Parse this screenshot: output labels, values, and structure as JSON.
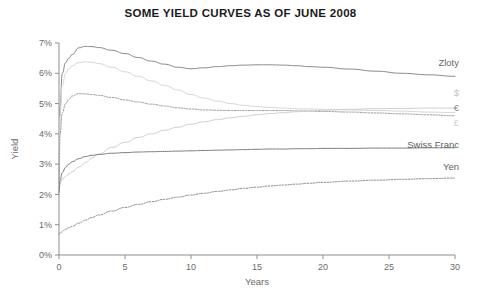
{
  "chart_data": {
    "type": "line",
    "title": "SOME YIELD CURVES AS OF JUNE 2008",
    "xlabel": "Years",
    "ylabel": "Yield",
    "xlim": [
      0,
      30
    ],
    "ylim": [
      0,
      7
    ],
    "xticks": [
      0,
      5,
      10,
      15,
      20,
      25,
      30
    ],
    "xtick_labels": [
      "0",
      "5",
      "10",
      "15",
      "20",
      "25",
      "30"
    ],
    "yticks": [
      0,
      1,
      2,
      3,
      4,
      5,
      6,
      7
    ],
    "ytick_labels": [
      "0%",
      "1%",
      "2%",
      "3%",
      "4%",
      "5%",
      "6%",
      "7%"
    ],
    "grid": false,
    "legend_position": "right-inline-labels",
    "series": [
      {
        "name": "Zloty",
        "label": "Zloty",
        "color": "#8a8a8a",
        "style": "solid",
        "width": 1.0,
        "label_color": "#6a6a6a",
        "x": [
          0,
          0.08,
          0.25,
          0.5,
          0.75,
          1,
          1.5,
          2,
          2.5,
          3,
          4,
          5,
          6,
          7,
          8,
          9,
          10,
          11,
          12,
          13,
          14,
          15,
          16,
          17,
          18,
          19,
          20,
          22,
          24,
          26,
          28,
          30
        ],
        "y": [
          2.35,
          4.9,
          6.0,
          6.35,
          6.5,
          6.62,
          6.84,
          6.89,
          6.88,
          6.85,
          6.76,
          6.65,
          6.52,
          6.4,
          6.3,
          6.2,
          6.15,
          6.18,
          6.22,
          6.25,
          6.27,
          6.28,
          6.28,
          6.27,
          6.25,
          6.22,
          6.2,
          6.14,
          6.07,
          6.0,
          5.95,
          5.9
        ]
      },
      {
        "name": "Pound",
        "label": "£",
        "color": "#d6d6d6",
        "style": "solid",
        "width": 1.0,
        "label_color": "#d0d0d0",
        "x": [
          0,
          0.08,
          0.25,
          0.5,
          0.75,
          1,
          1.5,
          2,
          2.5,
          3,
          4,
          5,
          6,
          7,
          8,
          9,
          10,
          11,
          12,
          13,
          14,
          15,
          16,
          17,
          18,
          19,
          20,
          22,
          24,
          26,
          28,
          30
        ],
        "y": [
          2.3,
          4.6,
          5.6,
          6.0,
          6.15,
          6.25,
          6.35,
          6.38,
          6.36,
          6.32,
          6.2,
          6.05,
          5.9,
          5.75,
          5.6,
          5.45,
          5.3,
          5.18,
          5.08,
          5.0,
          4.94,
          4.9,
          4.87,
          4.85,
          4.83,
          4.82,
          4.81,
          4.79,
          4.77,
          4.75,
          4.72,
          4.7
        ]
      },
      {
        "name": "Euro",
        "label": "€",
        "color": "#9a9a9a",
        "style": "dotted",
        "width": 1.0,
        "label_color": "#8a8a8a",
        "x": [
          0,
          0.08,
          0.25,
          0.5,
          0.75,
          1,
          1.5,
          2,
          2.5,
          3,
          4,
          5,
          6,
          7,
          8,
          9,
          10,
          11,
          12,
          13,
          14,
          15,
          16,
          17,
          18,
          19,
          20,
          22,
          24,
          26,
          28,
          30
        ],
        "y": [
          2.2,
          4.0,
          4.7,
          5.0,
          5.15,
          5.25,
          5.33,
          5.32,
          5.3,
          5.27,
          5.2,
          5.12,
          5.05,
          4.98,
          4.92,
          4.86,
          4.82,
          4.79,
          4.78,
          4.77,
          4.77,
          4.77,
          4.77,
          4.77,
          4.76,
          4.75,
          4.74,
          4.72,
          4.69,
          4.66,
          4.63,
          4.6
        ]
      },
      {
        "name": "Dollar",
        "label": "$",
        "color": "#cfcfcf",
        "style": "solid",
        "width": 1.0,
        "label_color": "#c5c5c5",
        "x": [
          0,
          0.08,
          0.25,
          0.5,
          0.75,
          1,
          1.5,
          2,
          2.5,
          3,
          4,
          5,
          6,
          7,
          8,
          9,
          10,
          11,
          12,
          13,
          14,
          15,
          16,
          17,
          18,
          19,
          20,
          22,
          24,
          26,
          28,
          30
        ],
        "y": [
          2.1,
          2.35,
          2.5,
          2.6,
          2.68,
          2.75,
          2.9,
          3.05,
          3.2,
          3.33,
          3.55,
          3.72,
          3.88,
          4.0,
          4.12,
          4.22,
          4.32,
          4.4,
          4.47,
          4.53,
          4.58,
          4.63,
          4.67,
          4.7,
          4.73,
          4.76,
          4.78,
          4.81,
          4.83,
          4.84,
          4.85,
          4.85
        ]
      },
      {
        "name": "Swiss Franc",
        "label": "Swiss Franc",
        "color": "#7d7d7d",
        "style": "solid",
        "width": 1.0,
        "label_color": "#5f5f5f",
        "x": [
          0,
          0.08,
          0.25,
          0.5,
          0.75,
          1,
          1.5,
          2,
          2.5,
          3,
          4,
          5,
          6,
          7,
          8,
          9,
          10,
          11,
          12,
          13,
          14,
          15,
          16,
          17,
          18,
          19,
          20,
          22,
          24,
          26,
          28,
          30
        ],
        "y": [
          2.05,
          2.45,
          2.72,
          2.9,
          3.0,
          3.08,
          3.18,
          3.25,
          3.29,
          3.32,
          3.36,
          3.38,
          3.4,
          3.41,
          3.42,
          3.43,
          3.44,
          3.45,
          3.46,
          3.47,
          3.48,
          3.49,
          3.5,
          3.5,
          3.51,
          3.51,
          3.52,
          3.52,
          3.53,
          3.53,
          3.54,
          3.54
        ]
      },
      {
        "name": "Yen",
        "label": "Yen",
        "color": "#8a8a8a",
        "style": "dotted",
        "width": 1.0,
        "label_color": "#5f5f5f",
        "x": [
          0,
          0.08,
          0.25,
          0.5,
          0.75,
          1,
          1.5,
          2,
          2.5,
          3,
          4,
          5,
          6,
          7,
          8,
          9,
          10,
          11,
          12,
          13,
          14,
          15,
          16,
          17,
          18,
          19,
          20,
          22,
          24,
          26,
          28,
          30
        ],
        "y": [
          0.68,
          0.72,
          0.78,
          0.85,
          0.9,
          0.95,
          1.05,
          1.15,
          1.24,
          1.32,
          1.45,
          1.57,
          1.67,
          1.76,
          1.84,
          1.91,
          1.98,
          2.04,
          2.1,
          2.15,
          2.2,
          2.24,
          2.28,
          2.31,
          2.34,
          2.37,
          2.4,
          2.44,
          2.47,
          2.5,
          2.52,
          2.54
        ]
      }
    ]
  }
}
